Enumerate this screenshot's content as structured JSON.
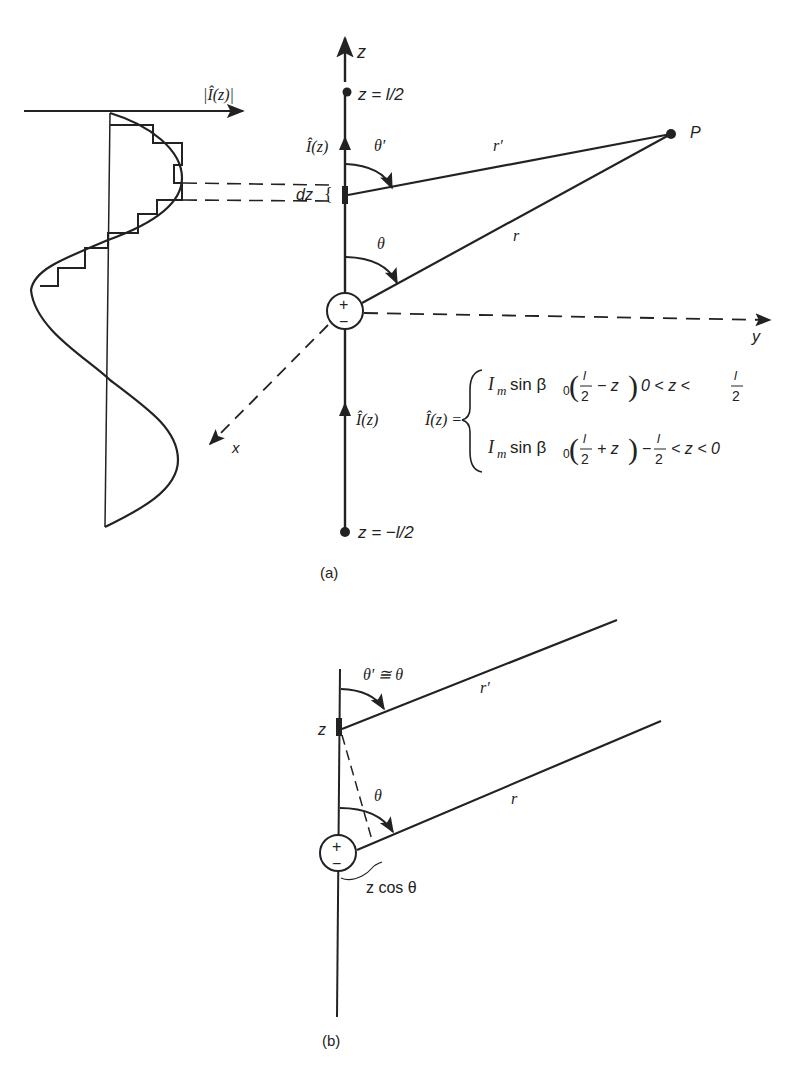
{
  "figure_a": {
    "caption": "(a)",
    "current_axis_label": "|Î(z)|",
    "z_axis_label": "z",
    "y_axis_label": "y",
    "x_axis_label": "x",
    "top_end_label": "z = l/2",
    "bottom_end_label": "z = −l/2",
    "current_label_upper": "Î(z)",
    "current_label_lower": "Î(z)",
    "theta_prime_label": "θ′",
    "theta_label": "θ",
    "r_prime_label": "r′",
    "r_label": "r",
    "point_label": "P",
    "dz_label": "dz",
    "source_plus": "+",
    "source_minus": "−",
    "equation": {
      "lhs": "Î(z) =",
      "case1": {
        "expr_prefix": "I",
        "sub": "m",
        "expr_mid": " sin β",
        "beta_sub": "0",
        "frac_num": "l",
        "frac_den": "2",
        "op": "− z",
        "condition": "0 < z <",
        "cond_num": "l",
        "cond_den": "2"
      },
      "case2": {
        "expr_prefix": "I",
        "sub": "m",
        "expr_mid": " sin β",
        "beta_sub": "0",
        "frac_num": "l",
        "frac_den": "2",
        "op": "+ z",
        "condition_prefix": "−",
        "cond_num": "l",
        "cond_den": "2",
        "condition": "< z < 0"
      }
    }
  },
  "figure_b": {
    "caption": "(b)",
    "theta_approx_label": "θ′ ≅ θ",
    "r_prime_label": "r′",
    "r_label": "r",
    "theta_label": "θ",
    "z_label": "z",
    "projection_label": "z cos θ",
    "source_plus": "+",
    "source_minus": "−"
  },
  "colors": {
    "ink": "#222222",
    "background": "#ffffff"
  }
}
